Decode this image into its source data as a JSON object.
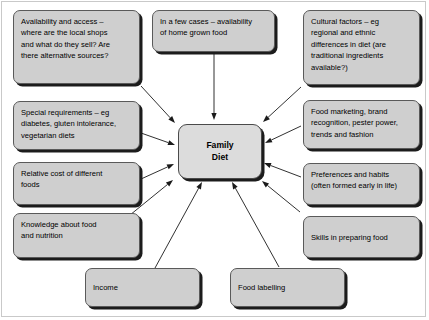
{
  "diagram": {
    "center": {
      "id": "family-diet",
      "label": "Family\nDiet"
    },
    "colors": {
      "node_fill": "#cfcfcf",
      "center_fill": "#dcdcdc",
      "node_border": "#5a5a5a",
      "shadow": "#1c1c1c",
      "arrow": "#1a1a1a",
      "background": "#ffffff",
      "frame_border": "#c9c9c9"
    },
    "nodes": [
      {
        "id": "availability-and-access",
        "label": "Availability and access –\nwhere are the local shops\nand what do they sell? Are\nthere alternative sources?",
        "x": 13,
        "y": 10,
        "w": 127,
        "h": 74
      },
      {
        "id": "home-grown-food",
        "label": "In a few cases – availability\nof home grown food",
        "x": 152,
        "y": 10,
        "w": 123,
        "h": 42
      },
      {
        "id": "cultural-factors",
        "label": "Cultural factors – eg\nregional and ethnic\ndifferences in diet (are\ntraditional ingredients\navailable?)",
        "x": 303,
        "y": 10,
        "w": 117,
        "h": 75
      },
      {
        "id": "special-requirements",
        "label": "Special requirements – eg\ndiabetes, gluten intolerance,\nvegetarian diets",
        "x": 13,
        "y": 101,
        "w": 127,
        "h": 49
      },
      {
        "id": "food-marketing",
        "label": "Food marketing, brand\nrecognition, pester power,\ntrends and fashion",
        "x": 303,
        "y": 100,
        "w": 117,
        "h": 49
      },
      {
        "id": "relative-cost",
        "label": "Relative cost of different\nfoods",
        "x": 13,
        "y": 162,
        "w": 127,
        "h": 43
      },
      {
        "id": "preferences-and-habits",
        "label": "Preferences and habits\n(often formed early in life)",
        "x": 303,
        "y": 163,
        "w": 117,
        "h": 42
      },
      {
        "id": "knowledge-about-food",
        "label": "Knowledge about food\nand nutrition",
        "x": 13,
        "y": 213,
        "w": 127,
        "h": 45
      },
      {
        "id": "skills-in-preparing-food",
        "label": "Skills in preparing food",
        "x": 303,
        "y": 216,
        "w": 117,
        "h": 42
      },
      {
        "id": "income",
        "label": "Income",
        "x": 85,
        "y": 268,
        "w": 115,
        "h": 39
      },
      {
        "id": "food-labelling",
        "label": "Food labelling",
        "x": 230,
        "y": 268,
        "w": 115,
        "h": 39
      }
    ],
    "arrows": [
      {
        "id": "arrow-availability-to-center",
        "from": "availability-and-access",
        "to": "family-diet",
        "x1": 141,
        "y1": 86,
        "x2": 175,
        "y2": 123
      },
      {
        "id": "arrow-homegrown-to-center",
        "from": "home-grown-food",
        "to": "family-diet",
        "x1": 214,
        "y1": 54,
        "x2": 214,
        "y2": 120
      },
      {
        "id": "arrow-cultural-to-center",
        "from": "cultural-factors",
        "to": "family-diet",
        "x1": 301,
        "y1": 87,
        "x2": 263,
        "y2": 122
      },
      {
        "id": "arrow-special-to-center",
        "from": "special-requirements",
        "to": "family-diet",
        "x1": 141,
        "y1": 133,
        "x2": 175,
        "y2": 145
      },
      {
        "id": "arrow-marketing-to-center",
        "from": "food-marketing",
        "to": "family-diet",
        "x1": 301,
        "y1": 126,
        "x2": 265,
        "y2": 143
      },
      {
        "id": "arrow-cost-to-center",
        "from": "relative-cost",
        "to": "family-diet",
        "x1": 141,
        "y1": 179,
        "x2": 174,
        "y2": 164
      },
      {
        "id": "arrow-preferences-to-center",
        "from": "preferences-and-habits",
        "to": "family-diet",
        "x1": 301,
        "y1": 177,
        "x2": 264,
        "y2": 163
      },
      {
        "id": "arrow-knowledge-to-center",
        "from": "knowledge-about-food",
        "to": "family-diet",
        "x1": 130,
        "y1": 215,
        "x2": 173,
        "y2": 180
      },
      {
        "id": "arrow-skills-to-center",
        "from": "skills-in-preparing-food",
        "to": "family-diet",
        "x1": 300,
        "y1": 212,
        "x2": 262,
        "y2": 181
      },
      {
        "id": "arrow-income-to-center",
        "from": "income",
        "to": "family-diet",
        "x1": 155,
        "y1": 268,
        "x2": 202,
        "y2": 182
      },
      {
        "id": "arrow-labelling-to-center",
        "from": "food-labelling",
        "to": "family-diet",
        "x1": 279,
        "y1": 267,
        "x2": 232,
        "y2": 182
      }
    ]
  }
}
